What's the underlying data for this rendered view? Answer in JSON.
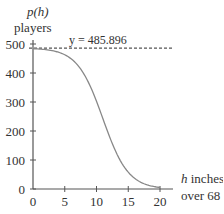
{
  "chart_data": {
    "type": "line",
    "title": "",
    "ylabel_func": "p(h)",
    "ylabel_unit": "players",
    "xlabel_var": "h",
    "xlabel_text": " inches",
    "xlabel_line2": "over 68",
    "asymptote_label": "y = 485.896",
    "asymptote_value": 485.896,
    "xlim": [
      0,
      20
    ],
    "ylim": [
      0,
      500
    ],
    "x_ticks": [
      0,
      5,
      10,
      15,
      20
    ],
    "x_tick_labels": [
      "0",
      "5",
      "10",
      "15",
      "20"
    ],
    "y_ticks": [
      0,
      100,
      200,
      300,
      400,
      500
    ],
    "y_tick_labels": [
      "0",
      "100",
      "200",
      "300",
      "400",
      "500"
    ],
    "grid": false,
    "series": [
      {
        "name": "p(h)",
        "color": "#888888",
        "x": [
          0,
          2,
          4,
          6,
          8,
          10,
          11,
          12,
          14,
          16,
          18,
          20
        ],
        "values": [
          483,
          476,
          458,
          411,
          315,
          190,
          243,
          166,
          88,
          37,
          14,
          5
        ]
      }
    ],
    "model": {
      "form": "logistic",
      "L": 485.896,
      "k": 0.5,
      "h0": 11
    }
  }
}
